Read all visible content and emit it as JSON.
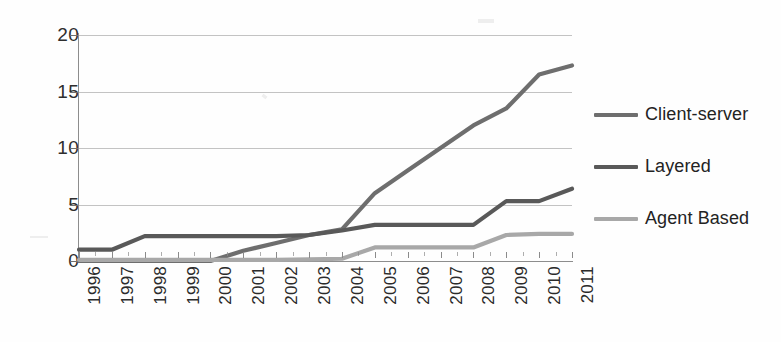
{
  "chart_data": {
    "type": "line",
    "title": "",
    "subtitle": "",
    "xlabel": "",
    "ylabel": "",
    "grid": true,
    "legend_position": "right",
    "ylim": [
      0,
      20
    ],
    "yticks": [
      0,
      5,
      10,
      15,
      20
    ],
    "categories": [
      "1996",
      "1997",
      "1998",
      "1999",
      "2000",
      "2001",
      "2002",
      "2003",
      "2004",
      "2005",
      "2006",
      "2007",
      "2008",
      "2009",
      "2010",
      "2011"
    ],
    "series": [
      {
        "name": "Client-server",
        "color": "#6e6e6e",
        "values": [
          0,
          0,
          0,
          0,
          0,
          0.9,
          1.6,
          2.3,
          2.8,
          6.0,
          8.0,
          10.0,
          12.0,
          13.5,
          16.5,
          17.3
        ]
      },
      {
        "name": "Layered",
        "color": "#595959",
        "values": [
          1.0,
          1.0,
          2.2,
          2.2,
          2.2,
          2.2,
          2.2,
          2.3,
          2.7,
          3.2,
          3.2,
          3.2,
          3.2,
          5.3,
          5.3,
          6.4
        ]
      },
      {
        "name": "Agent Based",
        "color": "#a8a8a8",
        "values": [
          0.1,
          0.1,
          0.1,
          0.1,
          0.1,
          0.1,
          0.1,
          0.15,
          0.2,
          1.2,
          1.2,
          1.2,
          1.2,
          2.3,
          2.4,
          2.4
        ]
      }
    ]
  },
  "legend": {
    "items": [
      {
        "label": "Client-server",
        "color": "#6e6e6e"
      },
      {
        "label": "Layered",
        "color": "#595959"
      },
      {
        "label": "Agent Based",
        "color": "#a8a8a8"
      }
    ]
  },
  "axes": {
    "y_ticks": [
      "20",
      "15",
      "10",
      "5",
      "0"
    ],
    "x_ticks": [
      "1996",
      "1997",
      "1998",
      "1999",
      "2000",
      "2001",
      "2002",
      "2003",
      "2004",
      "2005",
      "2006",
      "2007",
      "2008",
      "2009",
      "2010",
      "2011"
    ]
  }
}
